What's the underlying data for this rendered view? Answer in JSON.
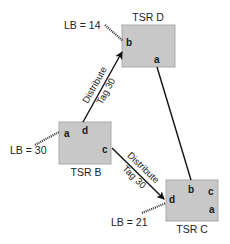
{
  "diagram": {
    "nodes": [
      {
        "id": "tsr_d",
        "label": "TSR D",
        "ports": [
          "b",
          "a"
        ],
        "lb_label": "LB = 14"
      },
      {
        "id": "tsr_b",
        "label": "TSR B",
        "ports": [
          "a",
          "d",
          "c"
        ],
        "lb_label": "LB = 30"
      },
      {
        "id": "tsr_c",
        "label": "TSR C",
        "ports": [
          "b",
          "c",
          "d",
          "a"
        ],
        "lb_label": "LB = 21"
      }
    ],
    "edges": [
      {
        "from": "tsr_b.d",
        "to": "tsr_d.b",
        "line1": "Distribute",
        "line2": "Tag 30",
        "arrow": true
      },
      {
        "from": "tsr_b.c",
        "to": "tsr_c.d",
        "line1": "Distribute",
        "line2": "Tag 30",
        "arrow": true
      },
      {
        "from": "tsr_d.a",
        "to": "tsr_c.b",
        "arrow": false
      }
    ]
  },
  "colors": {
    "box_fill": "#c8c8c8",
    "box_stroke": "#a9a9a9",
    "line": "#111111"
  }
}
